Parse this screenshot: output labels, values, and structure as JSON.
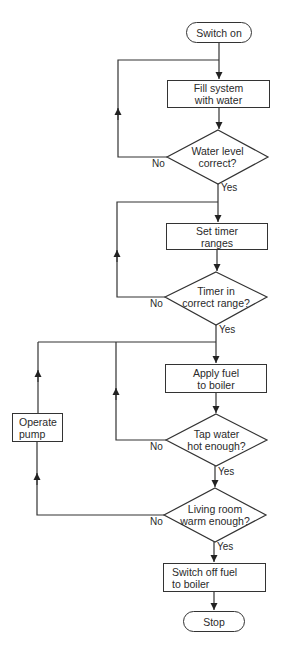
{
  "diagram": {
    "type": "flowchart",
    "start": {
      "label": "Switch on"
    },
    "end": {
      "label": "Stop"
    },
    "processes": [
      {
        "id": "fill",
        "line1": "Fill system",
        "line2": "with water"
      },
      {
        "id": "timer",
        "line1": "Set timer",
        "line2": "ranges"
      },
      {
        "id": "fuel",
        "line1": "Apply fuel",
        "line2": "to boiler"
      },
      {
        "id": "pump",
        "line1": "Operate",
        "line2": "pump"
      },
      {
        "id": "off",
        "line1": "Switch off fuel",
        "line2": "to boiler"
      }
    ],
    "decisions": [
      {
        "id": "water_level",
        "line1": "Water level",
        "line2": "correct?",
        "yes": "Yes",
        "no": "No"
      },
      {
        "id": "timer_range",
        "line1": "Timer in",
        "line2": "correct range?",
        "yes": "Yes",
        "no": "No"
      },
      {
        "id": "tap_water",
        "line1": "Tap water",
        "line2": "hot enough?",
        "yes": "Yes",
        "no": "No"
      },
      {
        "id": "living_room",
        "line1": "Living room",
        "line2": "warm enough?",
        "yes": "Yes",
        "no": "No"
      }
    ],
    "edges": [
      {
        "from": "Switch on",
        "to": "Fill system with water"
      },
      {
        "from": "Fill system with water",
        "to": "Water level correct?"
      },
      {
        "from": "Water level correct?",
        "to": "Fill system with water",
        "label": "No"
      },
      {
        "from": "Water level correct?",
        "to": "Set timer ranges",
        "label": "Yes"
      },
      {
        "from": "Set timer ranges",
        "to": "Timer in correct range?"
      },
      {
        "from": "Timer in correct range?",
        "to": "Set timer ranges",
        "label": "No"
      },
      {
        "from": "Timer in correct range?",
        "to": "Apply fuel to boiler",
        "label": "Yes"
      },
      {
        "from": "Apply fuel to boiler",
        "to": "Tap water hot enough?"
      },
      {
        "from": "Tap water hot enough?",
        "to": "Apply fuel to boiler",
        "label": "No"
      },
      {
        "from": "Tap water hot enough?",
        "to": "Living room warm enough?",
        "label": "Yes"
      },
      {
        "from": "Living room warm enough?",
        "to": "Operate pump",
        "label": "No"
      },
      {
        "from": "Operate pump",
        "to": "Apply fuel to boiler"
      },
      {
        "from": "Living room warm enough?",
        "to": "Switch off fuel to boiler",
        "label": "Yes"
      },
      {
        "from": "Switch off fuel to boiler",
        "to": "Stop"
      }
    ]
  }
}
